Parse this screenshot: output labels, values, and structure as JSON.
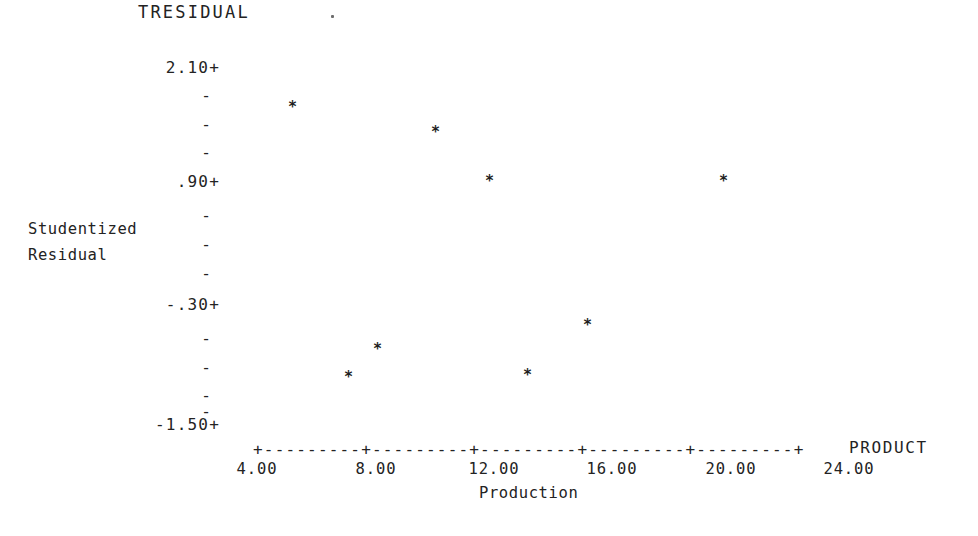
{
  "chart_data": {
    "type": "scatter",
    "title": "TRESIDUAL",
    "xlabel": "Production",
    "ylabel": "Studentized\nResidual",
    "x_variable_label": "PRODUCT",
    "grid": false,
    "legend": null,
    "marker": "*",
    "xlim": [
      4.0,
      26.0
    ],
    "ylim": [
      -1.5,
      2.1
    ],
    "x_ticks": [
      "4.00",
      "8.00",
      "12.00",
      "16.00",
      "20.00",
      "24.00"
    ],
    "x_tick_values": [
      4.0,
      8.0,
      12.0,
      16.0,
      20.0,
      24.0
    ],
    "y_ticks": [
      "2.10+",
      ".90+",
      "-.30+",
      "-1.50+"
    ],
    "y_tick_values": [
      2.1,
      0.9,
      -0.3,
      -1.5
    ],
    "y_minor_tick": "-",
    "y_minor_count_between": 4,
    "axis_style": "ascii-plus-dash",
    "points": [
      {
        "x": 5.5,
        "y": 1.75,
        "px": 292,
        "py": 107
      },
      {
        "x": 10.6,
        "y": 1.47,
        "px": 435,
        "py": 132
      },
      {
        "x": 12.5,
        "y": 0.92,
        "px": 489,
        "py": 181
      },
      {
        "x": 21.0,
        "y": 0.92,
        "px": 723,
        "py": 181
      },
      {
        "x": 7.1,
        "y": -1.02,
        "px": 348,
        "py": 377
      },
      {
        "x": 8.1,
        "y": -0.73,
        "px": 377,
        "py": 349
      },
      {
        "x": 13.2,
        "y": -1.0,
        "px": 527,
        "py": 375
      },
      {
        "x": 15.2,
        "y": -0.59,
        "px": 587,
        "py": 325
      }
    ]
  },
  "axis": {
    "x_line_ascii": "+---------+---------+---------+---------+---------+",
    "y_major_ticks": [
      {
        "label": "2.10+",
        "top": 60
      },
      {
        "label": ".90+",
        "top": 174
      },
      {
        "label": "-.30+",
        "top": 297
      },
      {
        "label": "-1.50+",
        "top": 417
      }
    ],
    "y_minor_ticks": [
      {
        "label": "-",
        "top": 88
      },
      {
        "label": "-",
        "top": 117
      },
      {
        "label": "-",
        "top": 145
      },
      {
        "label": "-",
        "top": 174
      },
      {
        "label": "-",
        "top": 208
      },
      {
        "label": "-",
        "top": 237
      },
      {
        "label": "-",
        "top": 266
      },
      {
        "label": "-",
        "top": 294
      },
      {
        "label": "-",
        "top": 331
      },
      {
        "label": "-",
        "top": 360
      },
      {
        "label": "-",
        "top": 388
      },
      {
        "label": "-",
        "top": 417
      }
    ],
    "x_tick_labels": [
      {
        "label": "4.00",
        "left": 222
      },
      {
        "label": "8.00",
        "left": 341
      },
      {
        "label": "12.00",
        "left": 459
      },
      {
        "label": "16.00",
        "left": 577
      },
      {
        "label": "20.00",
        "left": 696
      },
      {
        "label": "24.00",
        "left": 814
      }
    ]
  },
  "colors": {
    "ink": "#232323",
    "point": "#1e1e1e",
    "background": "#ffffff"
  }
}
